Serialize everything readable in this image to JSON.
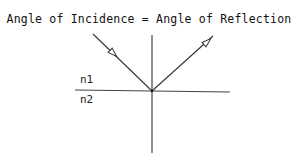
{
  "title": "Angle of Incidence = Angle of Reflection",
  "labels": {
    "upper_medium": "n1",
    "lower_medium": "n2"
  },
  "elements": {
    "incident_ray": {
      "from": [
        93,
        34
      ],
      "to": [
        152,
        91
      ],
      "arrow": "open-triangle"
    },
    "reflected_ray": {
      "from": [
        152,
        91
      ],
      "to": [
        213,
        36
      ],
      "arrow": "open-triangle"
    },
    "normal_line": {
      "from": [
        152,
        35
      ],
      "to": [
        152,
        153
      ]
    },
    "interface_line": {
      "from": [
        75,
        90
      ],
      "to": [
        230,
        92
      ]
    }
  },
  "colors": {
    "line": "#333333",
    "text": "#111111"
  }
}
